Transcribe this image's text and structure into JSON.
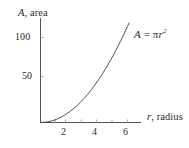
{
  "figure": {
    "background_color": "#ffffff",
    "ink_color": "#2b2b2b",
    "curve_color": "#404040",
    "axis_color": "#555555"
  },
  "axes": {
    "y_title_var": "A",
    "y_title_rest": ", area",
    "x_title_var": "r",
    "x_title_rest": ", radius",
    "y_ticks": [
      "100",
      "50"
    ],
    "x_ticks": [
      "2",
      "4",
      "6"
    ]
  },
  "annotation": {
    "lhs": "A",
    "eq": " = ",
    "pi": "π",
    "var": "r",
    "exp": "2"
  },
  "chart_data": {
    "type": "line",
    "title": "",
    "subtitle": "",
    "xlabel": "r, radius",
    "ylabel": "A, area",
    "equation": "A = πr²",
    "annotations": [
      "A = πr²"
    ],
    "legend": [],
    "legend_position": "none",
    "grid": false,
    "xlim": [
      0,
      6.45
    ],
    "ylim": [
      0,
      134
    ],
    "xticks": [
      2,
      4,
      6
    ],
    "yticks": [
      50,
      100
    ],
    "xtick_labels": [
      "2",
      "4",
      "6"
    ],
    "ytick_labels": [
      "50",
      "100"
    ],
    "minor_xticks": [
      1,
      2,
      3,
      4,
      5,
      6
    ],
    "series": [
      {
        "name": "A = πr²",
        "x": [
          0,
          0.25,
          0.5,
          0.75,
          1,
          1.25,
          1.5,
          1.75,
          2,
          2.25,
          2.5,
          2.75,
          3,
          3.25,
          3.5,
          3.75,
          4,
          4.25,
          4.5,
          4.75,
          5,
          5.25,
          5.5,
          5.75,
          6,
          6.1
        ],
        "y": [
          0,
          0.2,
          0.8,
          1.8,
          3.1,
          4.9,
          7.1,
          9.6,
          12.6,
          15.9,
          19.6,
          23.8,
          28.3,
          33.2,
          38.5,
          44.2,
          50.3,
          56.7,
          63.6,
          70.9,
          78.5,
          86.6,
          95.0,
          103.9,
          113.1,
          116.9
        ]
      }
    ]
  }
}
